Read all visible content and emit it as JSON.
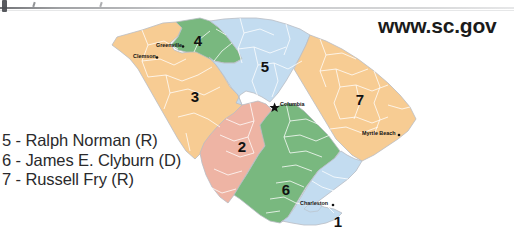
{
  "page": {
    "site_url": "www.sc.gov"
  },
  "legend": {
    "rows": [
      "5 - Ralph Norman (R)",
      "6 - James E. Clyburn (D)",
      "7 - Russell Fry (R)"
    ]
  },
  "map": {
    "title": "South Carolina congressional districts",
    "districts": [
      {
        "number": "1",
        "color": "#c3dcf0",
        "label_x": 248,
        "label_y": 214
      },
      {
        "number": "2",
        "color": "#eeb4a4",
        "label_x": 152,
        "label_y": 139
      },
      {
        "number": "3",
        "color": "#f7cc93",
        "label_x": 105,
        "label_y": 89
      },
      {
        "number": "4",
        "color": "#79b87f",
        "label_x": 108,
        "label_y": 33
      },
      {
        "number": "5",
        "color": "#c3dcf0",
        "label_x": 175,
        "label_y": 59
      },
      {
        "number": "6",
        "color": "#79b87f",
        "label_x": 196,
        "label_y": 182
      },
      {
        "number": "7",
        "color": "#f7cc93",
        "label_x": 270,
        "label_y": 92
      }
    ],
    "cities": [
      {
        "name": "Greenville",
        "marker": "dot",
        "label_x": 66,
        "label_y": 36,
        "dot_x": 92,
        "dot_y": 37
      },
      {
        "name": "Clemson",
        "marker": "dot",
        "label_x": 43,
        "label_y": 47,
        "dot_x": 67,
        "dot_y": 48
      },
      {
        "name": "Columbia",
        "marker": "star",
        "label_x": 190,
        "label_y": 95,
        "dot_x": 185,
        "dot_y": 99
      },
      {
        "name": "Myrtle Beach",
        "marker": "dot",
        "label_x": 272,
        "label_y": 124,
        "dot_x": 308,
        "dot_y": 126
      },
      {
        "name": "Charleston",
        "marker": "dot",
        "label_x": 210,
        "label_y": 194,
        "dot_x": 243,
        "dot_y": 195
      }
    ],
    "colors": {
      "blue": "#c3dcf0",
      "green": "#79b87f",
      "orange": "#f7cc93",
      "salmon": "#eeb4a4",
      "county_border": "#ffffff",
      "state_border": "#b9bdc4"
    }
  }
}
